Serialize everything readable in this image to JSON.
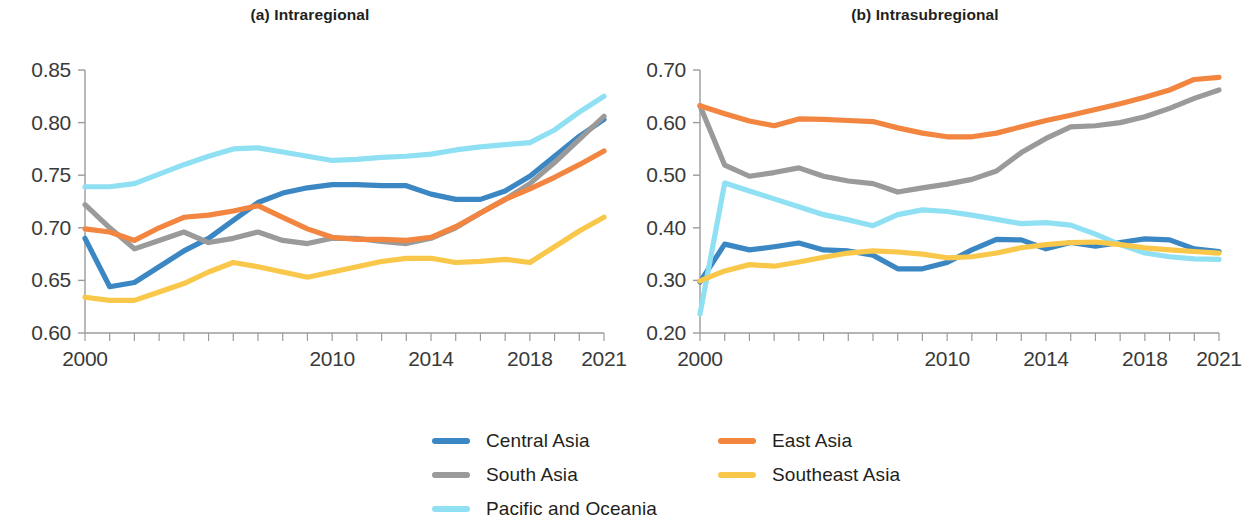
{
  "figure": {
    "background_color": "#ffffff"
  },
  "legend": {
    "position": "bottom",
    "items": [
      {
        "label": "Central Asia",
        "color": "#3b87c4",
        "column": 1,
        "row": 1
      },
      {
        "label": "South Asia",
        "color": "#9a9a9a",
        "column": 1,
        "row": 2
      },
      {
        "label": "Pacific and Oceania",
        "color": "#8fe0f2",
        "column": 1,
        "row": 3
      },
      {
        "label": "East Asia",
        "color": "#f2853f",
        "column": 2,
        "row": 1
      },
      {
        "label": "Southeast Asia",
        "color": "#f9c githubfix"
      }
    ]
  },
  "chart_data": [
    {
      "id": "a",
      "type": "line",
      "title": "(a) Intraregional",
      "xlabel": "",
      "ylabel": "",
      "xlim": [
        2000,
        2021
      ],
      "ylim": [
        0.6,
        0.85
      ],
      "yticks": [
        0.6,
        0.65,
        0.7,
        0.75,
        0.8,
        0.85
      ],
      "ytick_labels": [
        "0.60",
        "0.65",
        "0.70",
        "0.75",
        "0.80",
        "0.85"
      ],
      "xticks": [
        2000,
        2001,
        2002,
        2003,
        2004,
        2005,
        2006,
        2007,
        2008,
        2009,
        2010,
        2011,
        2012,
        2013,
        2014,
        2015,
        2016,
        2017,
        2018,
        2019,
        2020,
        2021
      ],
      "xtick_labels_shown": [
        "2000",
        "2010",
        "2014",
        "2018",
        "2021"
      ],
      "xtick_labels_shown_values": [
        2000,
        2010,
        2014,
        2018,
        2021
      ],
      "grid": false,
      "x": [
        2000,
        2001,
        2002,
        2003,
        2004,
        2005,
        2006,
        2007,
        2008,
        2009,
        2010,
        2011,
        2012,
        2013,
        2014,
        2015,
        2016,
        2017,
        2018,
        2019,
        2020,
        2021
      ],
      "series": [
        {
          "name": "Central Asia",
          "color": "#3b87c4",
          "values": [
            0.69,
            0.644,
            0.648,
            0.663,
            0.678,
            0.69,
            0.707,
            0.724,
            0.733,
            0.738,
            0.741,
            0.741,
            0.74,
            0.74,
            0.732,
            0.727,
            0.727,
            0.735,
            0.749,
            0.768,
            0.787,
            0.803
          ]
        },
        {
          "name": "South Asia",
          "color": "#9a9a9a",
          "values": [
            0.722,
            0.7,
            0.68,
            0.688,
            0.696,
            0.686,
            0.69,
            0.696,
            0.688,
            0.685,
            0.69,
            0.69,
            0.687,
            0.685,
            0.69,
            0.7,
            0.714,
            0.727,
            0.742,
            0.762,
            0.784,
            0.806
          ]
        },
        {
          "name": "Pacific and Oceania",
          "color": "#8fe0f2",
          "values": [
            0.739,
            0.739,
            0.742,
            0.751,
            0.76,
            0.768,
            0.775,
            0.776,
            0.772,
            0.768,
            0.764,
            0.765,
            0.767,
            0.768,
            0.77,
            0.774,
            0.777,
            0.779,
            0.781,
            0.793,
            0.81,
            0.825
          ]
        },
        {
          "name": "East Asia",
          "color": "#f2853f",
          "values": [
            0.699,
            0.696,
            0.688,
            0.7,
            0.71,
            0.712,
            0.716,
            0.721,
            0.71,
            0.699,
            0.691,
            0.689,
            0.689,
            0.688,
            0.691,
            0.701,
            0.714,
            0.727,
            0.737,
            0.748,
            0.76,
            0.773
          ]
        },
        {
          "name": "Southeast Asia",
          "color": "#f9c84a",
          "values": [
            0.634,
            0.631,
            0.631,
            0.639,
            0.647,
            0.658,
            0.667,
            0.663,
            0.658,
            0.653,
            0.658,
            0.663,
            0.668,
            0.671,
            0.671,
            0.667,
            0.668,
            0.67,
            0.667,
            0.682,
            0.697,
            0.71
          ]
        }
      ]
    },
    {
      "id": "b",
      "type": "line",
      "title": "(b) Intrasubregional",
      "xlabel": "",
      "ylabel": "",
      "xlim": [
        2000,
        2021
      ],
      "ylim": [
        0.2,
        0.7
      ],
      "yticks": [
        0.2,
        0.3,
        0.4,
        0.5,
        0.6,
        0.7
      ],
      "ytick_labels": [
        "0.20",
        "0.30",
        "0.40",
        "0.50",
        "0.60",
        "0.70"
      ],
      "xticks": [
        2000,
        2001,
        2002,
        2003,
        2004,
        2005,
        2006,
        2007,
        2008,
        2009,
        2010,
        2011,
        2012,
        2013,
        2014,
        2015,
        2016,
        2017,
        2018,
        2019,
        2020,
        2021
      ],
      "xtick_labels_shown": [
        "2000",
        "2010",
        "2014",
        "2018",
        "2021"
      ],
      "xtick_labels_shown_values": [
        2000,
        2010,
        2014,
        2018,
        2021
      ],
      "grid": false,
      "x": [
        2000,
        2001,
        2002,
        2003,
        2004,
        2005,
        2006,
        2007,
        2008,
        2009,
        2010,
        2011,
        2012,
        2013,
        2014,
        2015,
        2016,
        2017,
        2018,
        2019,
        2020,
        2021
      ],
      "series": [
        {
          "name": "Central Asia",
          "color": "#3b87c4",
          "values": [
            0.297,
            0.369,
            0.358,
            0.364,
            0.371,
            0.358,
            0.356,
            0.348,
            0.322,
            0.322,
            0.334,
            0.358,
            0.378,
            0.377,
            0.36,
            0.372,
            0.365,
            0.372,
            0.379,
            0.377,
            0.36,
            0.355
          ]
        },
        {
          "name": "South Asia",
          "color": "#9a9a9a",
          "values": [
            0.632,
            0.519,
            0.498,
            0.505,
            0.514,
            0.498,
            0.489,
            0.484,
            0.468,
            0.476,
            0.483,
            0.492,
            0.508,
            0.543,
            0.57,
            0.592,
            0.594,
            0.6,
            0.611,
            0.627,
            0.646,
            0.662
          ]
        },
        {
          "name": "Pacific and Oceania",
          "color": "#8fe0f2",
          "values": [
            0.236,
            0.485,
            0.47,
            0.455,
            0.44,
            0.425,
            0.415,
            0.404,
            0.425,
            0.434,
            0.431,
            0.424,
            0.416,
            0.408,
            0.41,
            0.405,
            0.388,
            0.368,
            0.352,
            0.345,
            0.341,
            0.34
          ]
        },
        {
          "name": "East Asia",
          "color": "#f2853f",
          "values": [
            0.632,
            0.617,
            0.603,
            0.594,
            0.607,
            0.606,
            0.604,
            0.602,
            0.59,
            0.58,
            0.573,
            0.573,
            0.58,
            0.592,
            0.604,
            0.614,
            0.625,
            0.636,
            0.648,
            0.662,
            0.682,
            0.686
          ]
        },
        {
          "name": "Southeast Asia",
          "color": "#f9c84a",
          "values": [
            0.299,
            0.318,
            0.33,
            0.327,
            0.335,
            0.344,
            0.352,
            0.356,
            0.354,
            0.35,
            0.343,
            0.345,
            0.352,
            0.362,
            0.368,
            0.372,
            0.373,
            0.368,
            0.362,
            0.358,
            0.355,
            0.352
          ]
        }
      ]
    }
  ]
}
